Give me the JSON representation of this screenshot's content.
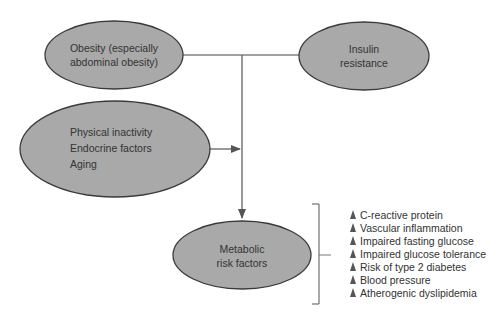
{
  "nodes": {
    "obesity": {
      "lines": [
        "Obesity (especially",
        "abdominal obesity)"
      ]
    },
    "insulin": {
      "lines": [
        "Insulin",
        "resistance"
      ]
    },
    "other": {
      "lines": [
        "Physical inactivity",
        "Endocrine factors",
        "Aging"
      ]
    },
    "metabolic": {
      "lines": [
        "Metabolic",
        "risk factors"
      ]
    }
  },
  "risk_list": {
    "marker": "increase-triangle-icon",
    "items": [
      "C-reactive protein",
      "Vascular inflammation",
      "Impaired fasting glucose",
      "Impaired glucose tolerance",
      "Risk of type 2 diabetes",
      "Blood pressure",
      "Atherogenic dyslipidemia"
    ]
  },
  "colors": {
    "node_fill": "#a9a9a9",
    "node_stroke": "#3a3a3a",
    "connector": "#555555",
    "text": "#333333"
  }
}
